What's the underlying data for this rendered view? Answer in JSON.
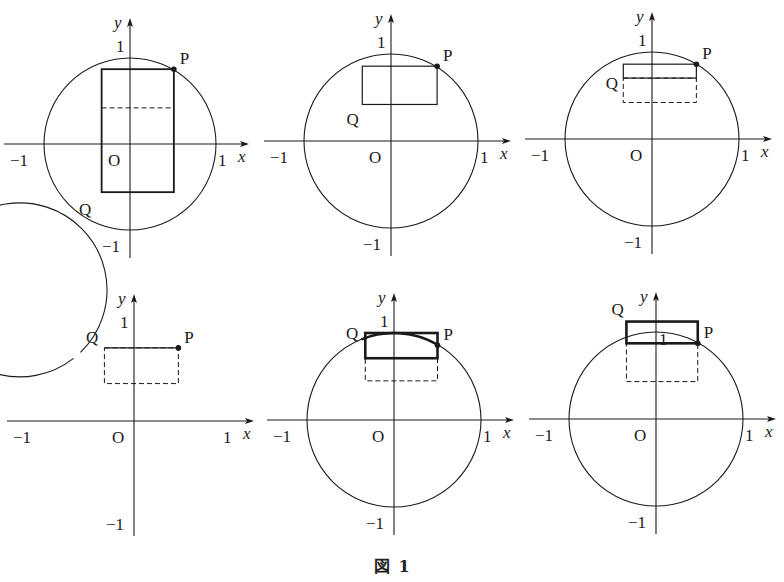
{
  "figure": {
    "caption_prefix": "図",
    "caption_number": "1"
  },
  "labels": {
    "x_axis": "x",
    "y_axis": "y",
    "origin": "O",
    "one": "1",
    "minus_one": "−1",
    "point_p": "P",
    "point_q": "Q"
  },
  "colors": {
    "ink": "#1a1a1a",
    "background": "#ffffff"
  },
  "panels": [
    {
      "id": "panel-1",
      "p": [
        0.51,
        0.87
      ],
      "rect": {
        "x0": -0.33,
        "x1": 0.51,
        "y0": -0.56,
        "y1": 0.87,
        "bold": false
      },
      "dashed_y": 0.42,
      "dashed_box": null,
      "segment": null,
      "q_label_pos": [
        -0.5,
        -0.75
      ],
      "top_one_over_rect": false
    },
    {
      "id": "panel-2",
      "p": [
        0.53,
        0.86
      ],
      "rect": {
        "x0": -0.33,
        "x1": 0.53,
        "y0": 0.42,
        "y1": 0.86,
        "bold": false
      },
      "dashed_y": null,
      "dashed_box": null,
      "segment": null,
      "q_label_pos": [
        -0.42,
        0.25
      ],
      "top_one_over_rect": false
    },
    {
      "id": "panel-3",
      "p": [
        0.51,
        0.86
      ],
      "rect": {
        "x0": -0.33,
        "x1": 0.51,
        "y0": 0.7,
        "y1": 0.86,
        "bold": false
      },
      "dashed_y": null,
      "dashed_box": {
        "x0": -0.33,
        "x1": 0.51,
        "y0": 0.42,
        "y1": 0.7
      },
      "segment": null,
      "q_label_pos": [
        -0.44,
        0.64
      ],
      "top_one_over_rect": false
    },
    {
      "id": "panel-4",
      "p": [
        0.51,
        0.84
      ],
      "rect": null,
      "dashed_y": null,
      "dashed_box": {
        "x0": -0.34,
        "x1": 0.51,
        "y0": 0.43,
        "y1": 0.84
      },
      "segment": {
        "x0": -0.34,
        "x1": 0.51,
        "y": 0.84
      },
      "q_label_pos": [
        -0.46,
        0.96
      ],
      "top_one_over_rect": false,
      "circle_gap_deg": [
        128,
        134
      ]
    },
    {
      "id": "panel-5",
      "p": [
        0.5,
        0.86
      ],
      "rect": {
        "x0": -0.33,
        "x1": 0.5,
        "y0": 0.71,
        "y1": 1.0,
        "bold": true
      },
      "dashed_y": null,
      "dashed_box": {
        "x0": -0.33,
        "x1": 0.5,
        "y0": 0.45,
        "y1": 0.71
      },
      "segment": null,
      "q_label_pos": [
        -0.46,
        1.0
      ],
      "top_one_over_rect": false,
      "bold_arc_deg": [
        60,
        112
      ]
    },
    {
      "id": "panel-6",
      "p": [
        0.48,
        0.87
      ],
      "rect": {
        "x0": -0.34,
        "x1": 0.48,
        "y0": 0.87,
        "y1": 1.12,
        "bold": true
      },
      "dashed_y": null,
      "dashed_box": {
        "x0": -0.34,
        "x1": 0.48,
        "y0": 0.43,
        "y1": 0.87
      },
      "segment": null,
      "q_label_pos": [
        -0.42,
        1.27
      ],
      "top_one_over_rect": true
    }
  ]
}
